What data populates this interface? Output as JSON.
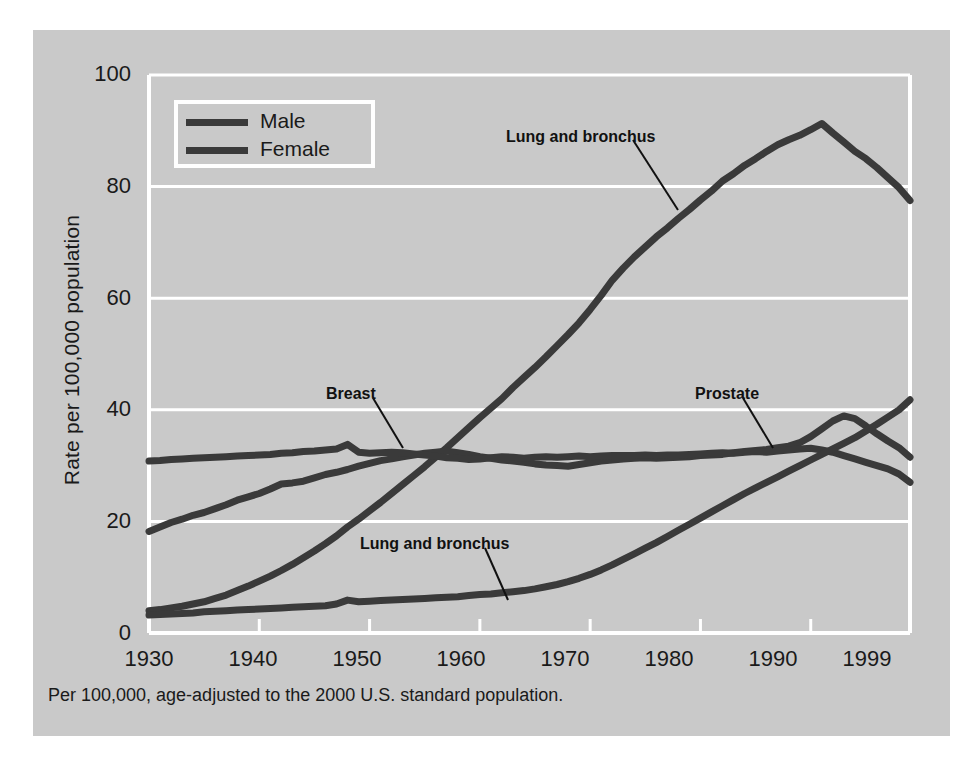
{
  "figure": {
    "footnote": "Per 100,000, age-adjusted to the 2000 U.S. standard population.",
    "panel_color": "#c9c9c9",
    "page_color": "#ffffff",
    "line_color": "#3a3a3a",
    "grid_color": "#ffffff"
  },
  "legend": {
    "items": [
      {
        "label": "Male",
        "color": "#3a3a3a"
      },
      {
        "label": "Female",
        "color": "#3a3a3a"
      }
    ]
  },
  "annotations": [
    {
      "id": "lung-male",
      "text": "Lung and bronchus"
    },
    {
      "id": "breast",
      "text": "Breast"
    },
    {
      "id": "prostate",
      "text": "Prostate"
    },
    {
      "id": "lung-female",
      "text": "Lung and bronchus"
    }
  ],
  "axes": {
    "y_ticks": [
      "0",
      "20",
      "40",
      "60",
      "80",
      "100"
    ],
    "x_ticks": [
      "1930",
      "1940",
      "1950",
      "1960",
      "1970",
      "1980",
      "1990",
      "1999"
    ],
    "ylabel": "Rate per 100,000 population"
  },
  "chart_data": {
    "type": "line",
    "title": "",
    "xlabel": "",
    "ylabel": "Rate per 100,000 population",
    "xlim": [
      1930,
      1999
    ],
    "ylim": [
      0,
      100
    ],
    "grid": true,
    "legend_position": "upper-left-inside",
    "x_tick_values": [
      1930,
      1940,
      1950,
      1960,
      1970,
      1980,
      1990,
      1999
    ],
    "y_tick_values": [
      0,
      20,
      40,
      60,
      80,
      100
    ],
    "x": [
      1930,
      1931,
      1932,
      1933,
      1934,
      1935,
      1936,
      1937,
      1938,
      1939,
      1940,
      1941,
      1942,
      1943,
      1944,
      1945,
      1946,
      1947,
      1948,
      1949,
      1950,
      1951,
      1952,
      1953,
      1954,
      1955,
      1956,
      1957,
      1958,
      1959,
      1960,
      1961,
      1962,
      1963,
      1964,
      1965,
      1966,
      1967,
      1968,
      1969,
      1970,
      1971,
      1972,
      1973,
      1974,
      1975,
      1976,
      1977,
      1978,
      1979,
      1980,
      1981,
      1982,
      1983,
      1984,
      1985,
      1986,
      1987,
      1988,
      1989,
      1990,
      1991,
      1992,
      1993,
      1994,
      1995,
      1996,
      1997,
      1998,
      1999
    ],
    "series": [
      {
        "name": "Lung and bronchus",
        "sex": "Male",
        "color": "#3a3a3a",
        "annotation": "Lung and bronchus",
        "values": [
          4.0,
          4.2,
          4.5,
          4.8,
          5.2,
          5.6,
          6.2,
          6.8,
          7.6,
          8.4,
          9.3,
          10.2,
          11.2,
          12.3,
          13.5,
          14.7,
          16.0,
          17.4,
          19.0,
          20.4,
          21.9,
          23.4,
          25.0,
          26.6,
          28.2,
          29.8,
          31.5,
          33.2,
          35.0,
          36.8,
          38.6,
          40.3,
          42.0,
          44.0,
          45.8,
          47.6,
          49.5,
          51.5,
          53.5,
          55.6,
          58.0,
          60.5,
          63.2,
          65.4,
          67.4,
          69.2,
          71.0,
          72.6,
          74.3,
          75.9,
          77.6,
          79.2,
          81.0,
          82.3,
          83.8,
          85.0,
          86.3,
          87.5,
          88.4,
          89.2,
          90.2,
          91.3,
          89.6,
          88.0,
          86.3,
          85.0,
          83.4,
          81.6,
          79.8,
          77.5
        ]
      },
      {
        "name": "Prostate",
        "sex": "Male",
        "color": "#3a3a3a",
        "annotation": "Prostate",
        "values": [
          18.2,
          19.0,
          19.8,
          20.4,
          21.1,
          21.6,
          22.3,
          23.0,
          23.8,
          24.4,
          25.0,
          25.8,
          26.7,
          26.9,
          27.2,
          27.8,
          28.4,
          28.8,
          29.3,
          29.9,
          30.4,
          30.9,
          31.2,
          31.6,
          31.9,
          32.2,
          32.4,
          32.6,
          32.3,
          32.0,
          31.6,
          31.3,
          31.0,
          30.8,
          30.6,
          30.3,
          30.1,
          30.0,
          29.9,
          30.2,
          30.5,
          30.8,
          31.0,
          31.2,
          31.3,
          31.4,
          31.3,
          31.4,
          31.5,
          31.6,
          31.8,
          31.9,
          32.0,
          32.3,
          32.5,
          32.7,
          32.9,
          33.2,
          33.5,
          34.1,
          35.2,
          36.6,
          38.0,
          38.9,
          38.4,
          37.1,
          35.7,
          34.4,
          33.2,
          31.5
        ]
      },
      {
        "name": "Breast",
        "sex": "Female",
        "color": "#3a3a3a",
        "annotation": "Breast",
        "values": [
          30.8,
          30.9,
          31.1,
          31.2,
          31.3,
          31.4,
          31.5,
          31.6,
          31.7,
          31.8,
          31.9,
          32.0,
          32.2,
          32.3,
          32.5,
          32.6,
          32.8,
          33.0,
          33.8,
          32.4,
          32.2,
          32.3,
          32.4,
          32.3,
          32.1,
          31.9,
          31.7,
          31.4,
          31.3,
          31.1,
          31.2,
          31.4,
          31.6,
          31.5,
          31.3,
          31.5,
          31.6,
          31.5,
          31.6,
          31.7,
          31.6,
          31.7,
          31.8,
          31.8,
          31.8,
          31.9,
          31.8,
          31.9,
          31.9,
          32.0,
          32.1,
          32.2,
          32.3,
          32.2,
          32.4,
          32.5,
          32.4,
          32.6,
          32.8,
          33.0,
          33.1,
          32.8,
          32.4,
          31.8,
          31.2,
          30.6,
          30.0,
          29.4,
          28.5,
          27.0
        ]
      },
      {
        "name": "Lung and bronchus",
        "sex": "Female",
        "color": "#3a3a3a",
        "annotation": "Lung and bronchus",
        "values": [
          3.2,
          3.3,
          3.4,
          3.5,
          3.6,
          3.8,
          3.9,
          4.0,
          4.1,
          4.2,
          4.3,
          4.4,
          4.5,
          4.6,
          4.7,
          4.8,
          4.9,
          5.2,
          5.9,
          5.6,
          5.7,
          5.8,
          5.9,
          6.0,
          6.1,
          6.2,
          6.3,
          6.4,
          6.5,
          6.7,
          6.9,
          7.0,
          7.2,
          7.4,
          7.6,
          7.9,
          8.3,
          8.7,
          9.2,
          9.8,
          10.5,
          11.3,
          12.2,
          13.2,
          14.2,
          15.2,
          16.2,
          17.3,
          18.4,
          19.5,
          20.6,
          21.7,
          22.8,
          23.9,
          25.0,
          26.0,
          27.0,
          28.0,
          29.0,
          30.0,
          31.0,
          32.0,
          33.0,
          34.0,
          35.0,
          36.2,
          37.4,
          38.7,
          40.0,
          41.8
        ]
      }
    ]
  }
}
